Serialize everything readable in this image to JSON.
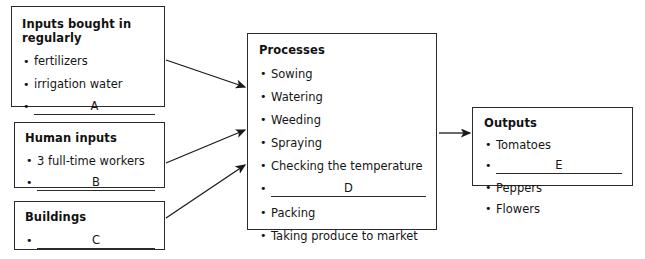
{
  "diagram": {
    "title_hidden": "",
    "boxes": {
      "inputs": {
        "title": "Inputs bought in regularly",
        "items": [
          {
            "type": "text",
            "label": "fertilizers"
          },
          {
            "type": "text",
            "label": "irrigation water"
          },
          {
            "type": "blank",
            "label": "A"
          }
        ]
      },
      "human": {
        "title": "Human inputs",
        "items": [
          {
            "type": "text",
            "label": "3 full-time workers"
          },
          {
            "type": "blank",
            "label": "B"
          }
        ]
      },
      "buildings": {
        "title": "Buildings",
        "items": [
          {
            "type": "blank",
            "label": "C"
          }
        ]
      },
      "processes": {
        "title": "Processes",
        "items": [
          {
            "type": "text",
            "label": "Sowing"
          },
          {
            "type": "text",
            "label": "Watering"
          },
          {
            "type": "text",
            "label": "Weeding"
          },
          {
            "type": "text",
            "label": "Spraying"
          },
          {
            "type": "text",
            "label": "Checking the temperature"
          },
          {
            "type": "blank",
            "label": "D"
          },
          {
            "type": "text",
            "label": "Packing"
          },
          {
            "type": "text",
            "label": "Taking produce to market"
          }
        ]
      },
      "outputs": {
        "title": "Outputs",
        "items": [
          {
            "type": "text",
            "label": "Tomatoes"
          },
          {
            "type": "blank",
            "label": "E"
          },
          {
            "type": "text",
            "label": "Peppers"
          },
          {
            "type": "text",
            "label": "Flowers"
          }
        ]
      }
    },
    "arrows": [
      {
        "name": "arrow-inputs-to-processes",
        "from": "inputs",
        "to": "processes"
      },
      {
        "name": "arrow-human-to-processes",
        "from": "human",
        "to": "processes"
      },
      {
        "name": "arrow-buildings-to-processes",
        "from": "buildings",
        "to": "processes"
      },
      {
        "name": "arrow-processes-to-outputs",
        "from": "processes",
        "to": "outputs"
      }
    ],
    "colors": {
      "border": "#2b2b2b",
      "text": "#151515",
      "background": "#ffffff",
      "arrow": "#1a1a1a"
    }
  }
}
